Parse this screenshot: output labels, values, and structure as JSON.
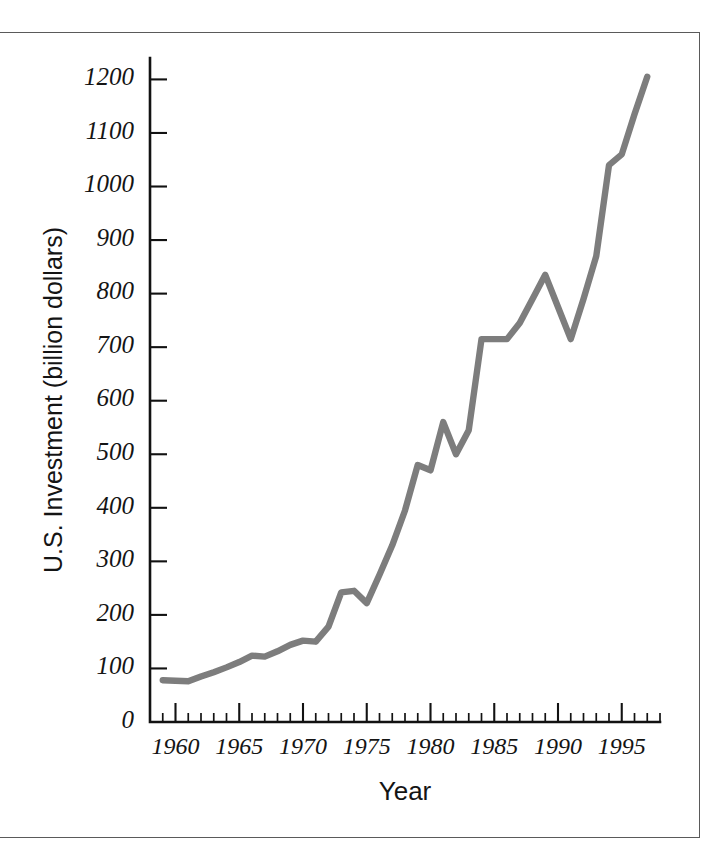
{
  "figure": {
    "has_border": true,
    "background_color": "#ffffff",
    "border_color": "#5a5a5a"
  },
  "chart_data": {
    "type": "line",
    "title": "",
    "xlabel": "Year",
    "ylabel": "U.S. Investment (billion dollars)",
    "xlim": [
      1958,
      1998
    ],
    "ylim": [
      0,
      1240
    ],
    "grid": false,
    "legend": null,
    "line_color": "#7d7d7d",
    "axis_color": "#121212",
    "y_ticks": [
      0,
      100,
      200,
      300,
      400,
      500,
      600,
      700,
      800,
      900,
      1000,
      1100,
      1200
    ],
    "y_tick_labels": [
      "0",
      "100",
      "200",
      "300",
      "400",
      "500",
      "600",
      "700",
      "800",
      "900",
      "1000",
      "1100",
      "1200"
    ],
    "x_ticks": [
      1960,
      1965,
      1970,
      1975,
      1980,
      1985,
      1990,
      1995
    ],
    "x_tick_labels": [
      "1960",
      "1965",
      "1970",
      "1975",
      "1980",
      "1985",
      "1990",
      "1995"
    ],
    "x_minor_tick_step": 1,
    "x": [
      1959,
      1960,
      1961,
      1962,
      1963,
      1964,
      1965,
      1966,
      1967,
      1968,
      1969,
      1970,
      1971,
      1972,
      1973,
      1974,
      1975,
      1976,
      1977,
      1978,
      1979,
      1980,
      1981,
      1982,
      1983,
      1984,
      1985,
      1986,
      1987,
      1988,
      1989,
      1990,
      1991,
      1992,
      1993,
      1994,
      1995,
      1996,
      1997
    ],
    "values": [
      78,
      77,
      76,
      85,
      93,
      102,
      112,
      124,
      122,
      132,
      144,
      152,
      150,
      178,
      242,
      245,
      222,
      275,
      330,
      395,
      480,
      470,
      560,
      500,
      545,
      715,
      715,
      715,
      745,
      790,
      835,
      775,
      715,
      790,
      870,
      1040,
      1060,
      1135,
      1205
    ],
    "units": "billion dollars",
    "annotations": []
  },
  "axis_titles": {
    "x": "Year",
    "y": "U.S. Investment (billion dollars)"
  }
}
